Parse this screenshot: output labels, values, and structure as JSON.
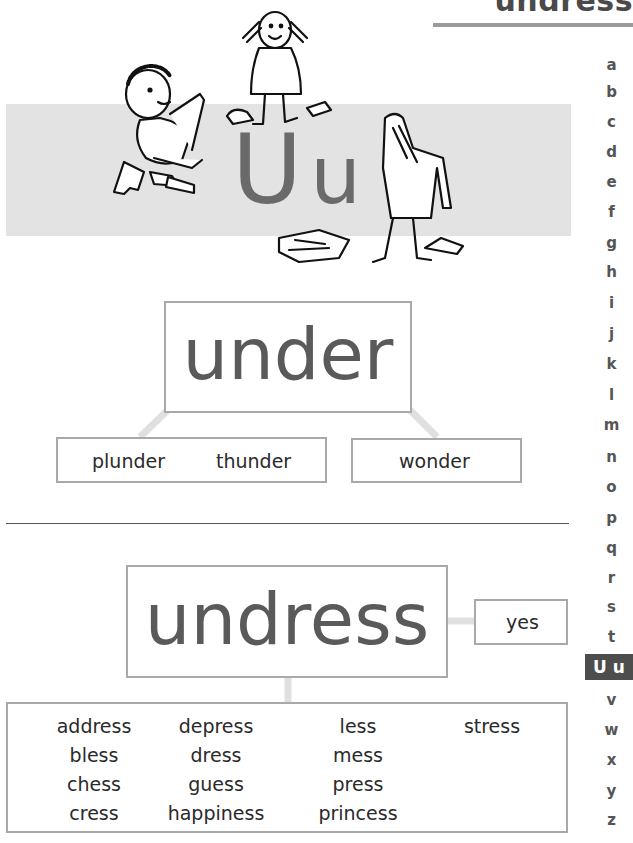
{
  "header": {
    "title": "undress"
  },
  "banner": {
    "letter_upper": "U",
    "letter_lower": "u",
    "illustration": "children-undressing-drawing"
  },
  "alphabet_index": {
    "items": [
      "a",
      "b",
      "c",
      "d",
      "e",
      "f",
      "g",
      "h",
      "i",
      "j",
      "k",
      "l",
      "m",
      "n",
      "o",
      "p",
      "q",
      "r",
      "s",
      "t",
      "U u",
      "v",
      "w",
      "x",
      "y",
      "z"
    ],
    "active": "U u"
  },
  "section_under": {
    "root_word": "under",
    "branches": [
      {
        "words": [
          "plunder",
          "thunder"
        ]
      },
      {
        "words": [
          "wonder"
        ]
      }
    ]
  },
  "section_undress": {
    "root_word": "undress",
    "side_label": "yes",
    "word_columns": [
      [
        "address",
        "bless",
        "chess",
        "cress"
      ],
      [
        "depress",
        "dress",
        "guess",
        "happiness"
      ],
      [
        "less",
        "mess",
        "press",
        "princess"
      ],
      [
        "stress"
      ]
    ]
  },
  "colors": {
    "banner_bg": "#e3e3e3",
    "big_letter": "#6a6a6a",
    "box_border": "#a9a9a9",
    "active_tab_bg": "#4d4d4d",
    "connector": "#e0e0e0"
  }
}
